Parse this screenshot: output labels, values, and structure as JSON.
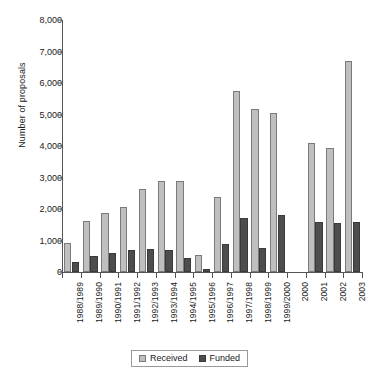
{
  "chart_data": {
    "type": "bar",
    "title": "",
    "xlabel": "",
    "ylabel": "Number of proposals",
    "ylim": [
      0,
      8000
    ],
    "ytick_step": 1000,
    "yticks": [
      "0",
      "1,000",
      "2,000",
      "3,000",
      "4,000",
      "5,000",
      "6,000",
      "7,000",
      "8,000"
    ],
    "grid": false,
    "legend_position": "bottom-center",
    "categories": [
      "1988/1989",
      "1989/1990",
      "1990/1991",
      "1991/1992",
      "1992/1993",
      "1993/1994",
      "1994/1995",
      "1995/1996",
      "1996/1997",
      "1997/1998",
      "1998/1999",
      "1999/2000",
      "2000",
      "2001",
      "2002",
      "2003"
    ],
    "series": [
      {
        "name": "Received",
        "color": "#bfbfbf",
        "values": [
          930,
          1630,
          1880,
          2060,
          2640,
          2890,
          2880,
          550,
          2390,
          5740,
          5190,
          5060,
          0,
          4080,
          3930,
          6700
        ]
      },
      {
        "name": "Funded",
        "color": "#4d4d4d",
        "values": [
          310,
          500,
          610,
          700,
          740,
          690,
          460,
          100,
          880,
          1700,
          760,
          1800,
          0,
          1580,
          1560,
          1600
        ]
      }
    ]
  },
  "legend": {
    "items": [
      {
        "label": "Received",
        "swatch": "received"
      },
      {
        "label": "Funded",
        "swatch": "funded"
      }
    ]
  }
}
